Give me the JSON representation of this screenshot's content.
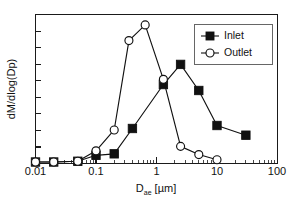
{
  "chart_data": {
    "type": "line",
    "title": "",
    "subtitle": "",
    "xlabel_main": "D",
    "xlabel_sub": "ae",
    "xlabel_unit": " [µm]",
    "xlabel": "D_ae [µm]",
    "ylabel": "dM/dlog(Dp)",
    "xscale": "log",
    "yscale": "linear",
    "xlim": [
      0.01,
      100
    ],
    "ylim": [
      0,
      1.0
    ],
    "xticks": [
      0.01,
      0.1,
      1,
      10,
      100
    ],
    "xtick_labels": [
      "0.01",
      "0.1",
      "1",
      "10",
      "100"
    ],
    "yticks": [
      0,
      0.111,
      0.222,
      0.333,
      0.444,
      0.556,
      0.667,
      0.778,
      0.889,
      1.0
    ],
    "ytick_labels": [],
    "grid": false,
    "legend_position": "top-right",
    "series": [
      {
        "name": "Inlet",
        "marker": "filled-square",
        "color": "#111111",
        "x": [
          0.01,
          0.02,
          0.05,
          0.1,
          0.2,
          0.4,
          1.3,
          2.5,
          5.0,
          10.0,
          30.0
        ],
        "values": [
          0.01,
          0.01,
          0.015,
          0.055,
          0.065,
          0.235,
          0.53,
          0.665,
          0.49,
          0.255,
          0.19
        ]
      },
      {
        "name": "Outlet",
        "marker": "open-circle",
        "color": "#111111",
        "x": [
          0.01,
          0.02,
          0.05,
          0.1,
          0.2,
          0.35,
          0.65,
          1.3,
          2.5,
          5.0,
          10.0
        ],
        "values": [
          0.01,
          0.01,
          0.015,
          0.085,
          0.225,
          0.825,
          0.93,
          0.565,
          0.115,
          0.06,
          0.025
        ]
      }
    ],
    "legend_entries": [
      {
        "label": "Inlet",
        "marker": "filled-square"
      },
      {
        "label": "Outlet",
        "marker": "open-circle"
      }
    ]
  }
}
